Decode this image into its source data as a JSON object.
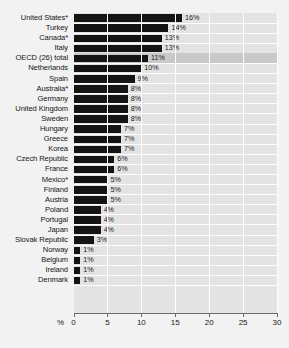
{
  "chart_data": {
    "type": "bar",
    "orientation": "horizontal",
    "title": "",
    "xlabel": "%",
    "ylabel": "",
    "xlim": [
      0,
      30
    ],
    "xticks": [
      0,
      5,
      10,
      15,
      20,
      25,
      30
    ],
    "grid": true,
    "grid_orientation": "vertical",
    "legend": "none",
    "categories": [
      "United States*",
      "Turkey",
      "Canada*",
      "Italy",
      "OECD (26) total",
      "Netherlands",
      "Spain",
      "Australia*",
      "Germany",
      "United Kingdom",
      "Sweden",
      "Hungary",
      "Greece",
      "Korea",
      "Czech Republic",
      "France",
      "Mexico*",
      "Finland",
      "Austria",
      "Poland",
      "Portugal",
      "Japan",
      "Slovak Republic",
      "Norway",
      "Belgium",
      "Ireland",
      "Denmark"
    ],
    "values": [
      16,
      14,
      13,
      13,
      11,
      10,
      9,
      8,
      8,
      8,
      8,
      7,
      7,
      7,
      6,
      6,
      5,
      5,
      5,
      4,
      4,
      4,
      3,
      1,
      1,
      1,
      1
    ],
    "value_labels": [
      "16%",
      "14%",
      "13%",
      "13%",
      "11%",
      "10%",
      "9%",
      "8%",
      "8%",
      "8%",
      "8%",
      "7%",
      "7%",
      "7%",
      "6%",
      "6%",
      "5%",
      "5%",
      "5%",
      "4%",
      "4%",
      "4%",
      "3%",
      "1%",
      "1%",
      "1%",
      "1%"
    ],
    "highlighted_category": "OECD (26) total",
    "colors": {
      "bar": "#141414",
      "plot_background": "#e3e3e3",
      "highlight_band": "#c9c9c9",
      "gridline": "#fdfdfd",
      "axis": "#6b6b6b",
      "page_background": "#f2f2f2",
      "text": "#161616"
    }
  }
}
